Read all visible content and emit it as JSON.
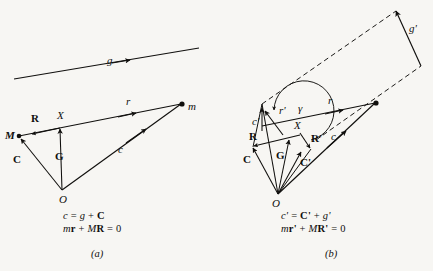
{
  "figure": {
    "background": "#f7f6f3",
    "ink": "#100f0d",
    "width": 433,
    "height": 271
  },
  "panel_a": {
    "caption": "(a)",
    "equations": {
      "line1": {
        "lhs": "c",
        "eq": "=",
        "term1": "g",
        "plus": "+",
        "term2": "C"
      },
      "line2": {
        "t1": "m",
        "t2": "r",
        "plus": "+",
        "t3": "M",
        "t4": "R",
        "eq": "=",
        "rhs": "0"
      }
    },
    "labels": {
      "g": "g",
      "r": "r",
      "c": "c",
      "m": "m",
      "M": "M",
      "R": "R",
      "X": "X",
      "C": "C",
      "G": "G",
      "O": "O"
    }
  },
  "panel_b": {
    "caption": "(b)",
    "equations": {
      "line1": {
        "lhs": "c'",
        "eq": "=",
        "term1": "C'",
        "plus": "+",
        "term2": "g'"
      },
      "line2": {
        "t1": "m",
        "t2": "r'",
        "plus": "+",
        "t3": "M",
        "t4": "R'",
        "eq": "=",
        "rhs": "0"
      }
    },
    "labels": {
      "g_prime": "g'",
      "r": "r",
      "c": "c",
      "r_prime": "r'",
      "c_prime": "c'",
      "gamma": "γ",
      "R": "R",
      "R_prime": "R'",
      "X": "X",
      "C": "C",
      "C_prime": "C'",
      "G": "G",
      "O": "O"
    }
  }
}
